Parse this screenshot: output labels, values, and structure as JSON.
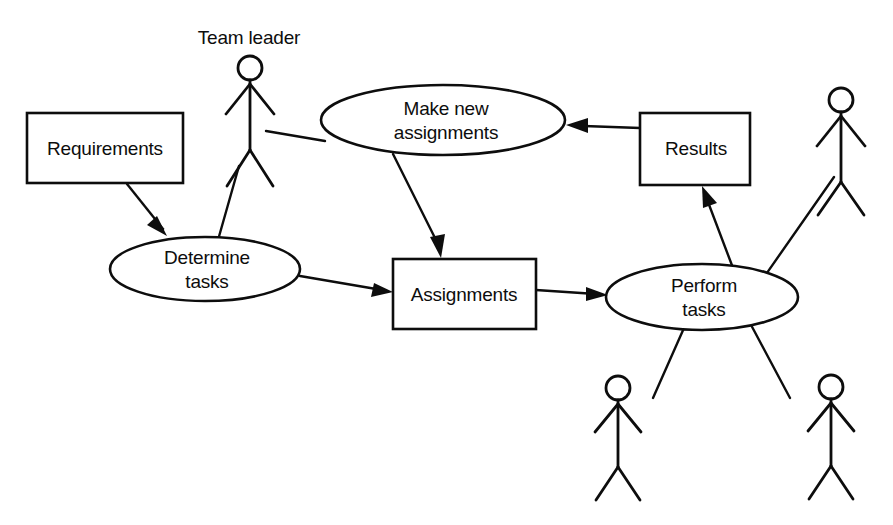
{
  "diagram": {
    "background_color": "#ffffff",
    "line_color": "#0d0d0d",
    "nodes": {
      "requirements": {
        "label": "Requirements",
        "type": "box"
      },
      "determine_tasks_line1": {
        "label": "Determine"
      },
      "determine_tasks_line2": {
        "label": "tasks"
      },
      "make_new_line1": {
        "label": "Make new"
      },
      "make_new_line2": {
        "label": "assignments"
      },
      "assignments": {
        "label": "Assignments",
        "type": "box"
      },
      "results": {
        "label": "Results",
        "type": "box"
      },
      "perform_tasks_line1": {
        "label": "Perform"
      },
      "perform_tasks_line2": {
        "label": "tasks"
      }
    },
    "actors": {
      "team_leader": {
        "label": "Team leader"
      },
      "worker_right": {
        "label": ""
      },
      "worker_bottom_left": {
        "label": ""
      },
      "worker_bottom_right": {
        "label": ""
      }
    },
    "flows": [
      {
        "from": "Requirements",
        "to": "Determine tasks",
        "arrow": true
      },
      {
        "from": "Determine tasks",
        "to": "Assignments",
        "arrow": true
      },
      {
        "from": "Make new assignments",
        "to": "Assignments",
        "arrow": true
      },
      {
        "from": "Assignments",
        "to": "Perform tasks",
        "arrow": true
      },
      {
        "from": "Perform tasks",
        "to": "Results",
        "arrow": true
      },
      {
        "from": "Results",
        "to": "Make new assignments",
        "arrow": true
      },
      {
        "from": "Team leader",
        "to": "Determine tasks",
        "arrow": false
      },
      {
        "from": "Team leader",
        "to": "Make new assignments",
        "arrow": false
      },
      {
        "from": "Worker",
        "to": "Perform tasks",
        "arrow": false
      }
    ]
  }
}
